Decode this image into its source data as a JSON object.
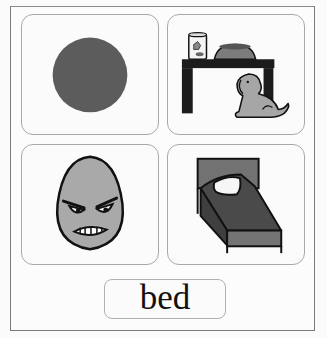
{
  "cards": [
    {
      "name": "red-circle",
      "description": "filled circle"
    },
    {
      "name": "dog-under-table",
      "description": "dog under a table with bowl and food jar"
    },
    {
      "name": "angry-egg",
      "description": "grumpy egg face"
    },
    {
      "name": "bed",
      "description": "bed with pillow"
    }
  ],
  "label": {
    "text": "bed"
  },
  "colors": {
    "circle": "#5a5a5a",
    "table": "#1c1c1c",
    "dog": "#a6a6a6",
    "egg": "#a9a9a9",
    "bed_frame": "#6e6e6e",
    "bed_blanket": "#4a4a4a",
    "outline": "#111111"
  }
}
